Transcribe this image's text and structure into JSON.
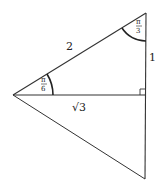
{
  "diagram": {
    "type": "geometry-triangle",
    "colors": {
      "stroke": "#333333",
      "background": "#ffffff",
      "text": "#222222"
    },
    "points": {
      "left": [
        13,
        95
      ],
      "top": [
        146,
        13
      ],
      "foot": [
        146,
        95
      ],
      "bottom": [
        145,
        179
      ]
    },
    "labels": {
      "hypotenuse": "2",
      "vertical_side": "1",
      "base": "√3",
      "angle_left_num": "π",
      "angle_left_den": "6",
      "angle_top_num": "π",
      "angle_top_den": "3"
    }
  }
}
